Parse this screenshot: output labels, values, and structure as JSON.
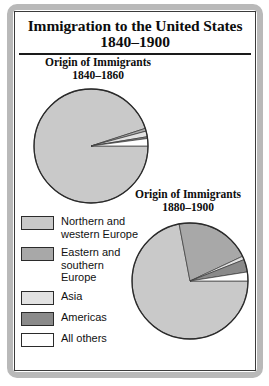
{
  "figure": {
    "title_line1": "Immigration to the United States",
    "title_line2": "1840–1900"
  },
  "legend": {
    "items": [
      {
        "label": "Northern and\nwestern Europe",
        "color": "#c9c9c9",
        "name": "northern-western-europe"
      },
      {
        "label": "Eastern and\nsouthern\nEurope",
        "color": "#a8a8a8",
        "name": "eastern-southern-europe"
      },
      {
        "label": "Asia",
        "color": "#e2e2e2",
        "name": "asia"
      },
      {
        "label": "Americas",
        "color": "#8a8a8a",
        "name": "americas"
      },
      {
        "label": "All others",
        "color": "#ffffff",
        "name": "all-others"
      }
    ]
  },
  "chart_data": [
    {
      "type": "pie",
      "title": "Origin of Immigrants\n1840–1860",
      "title_line1": "Origin of Immigrants",
      "title_line2": "1840–1860",
      "labels": [
        "Northern and western Europe",
        "Eastern and southern Europe",
        "Asia",
        "Americas",
        "All others"
      ],
      "values": [
        95.0,
        0.8,
        1.6,
        0.5,
        2.1
      ],
      "colors": [
        "#c9c9c9",
        "#a8a8a8",
        "#e2e2e2",
        "#8a8a8a",
        "#ffffff"
      ],
      "start_angle": 0,
      "direction": "clockwise",
      "legend_position": "left"
    },
    {
      "type": "pie",
      "title": "Origin of Immigrants\n1880–1900",
      "title_line1": "Origin of Immigrants",
      "title_line2": "1880–1900",
      "labels": [
        "Northern and western Europe",
        "Eastern and southern Europe",
        "Asia",
        "Americas",
        "All others"
      ],
      "values": [
        72.0,
        21.0,
        1.0,
        3.5,
        2.5
      ],
      "colors": [
        "#c9c9c9",
        "#a8a8a8",
        "#e2e2e2",
        "#8a8a8a",
        "#ffffff"
      ],
      "start_angle": 0,
      "direction": "clockwise",
      "legend_position": "left"
    }
  ]
}
